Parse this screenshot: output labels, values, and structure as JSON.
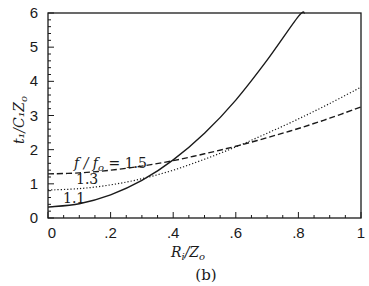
{
  "chart_data": {
    "type": "line",
    "title": "",
    "caption": "(b)",
    "xlabel": "R_i/Z_o",
    "ylabel": "t_1/C_1 Z_o",
    "xlim": [
      0,
      1
    ],
    "ylim": [
      0,
      6
    ],
    "xticks": [
      0,
      0.2,
      0.4,
      0.6,
      0.8,
      1
    ],
    "xtick_labels": [
      "0",
      ".2",
      ".4",
      ".6",
      ".8",
      "1"
    ],
    "yticks": [
      0,
      1,
      2,
      3,
      4,
      5,
      6
    ],
    "ytick_labels": [
      "0",
      "1",
      "2",
      "3",
      "4",
      "5",
      "6"
    ],
    "grid": false,
    "legend": "inline annotations",
    "series": [
      {
        "name": "f/f_o = 1.5",
        "style": "dashed",
        "x": [
          0,
          0.1,
          0.2,
          0.3,
          0.4,
          0.5,
          0.6,
          0.7,
          0.8,
          0.9,
          1.0
        ],
        "values": [
          1.29,
          1.32,
          1.4,
          1.52,
          1.68,
          1.88,
          2.1,
          2.35,
          2.62,
          2.92,
          3.25
        ]
      },
      {
        "name": "f/f_o = 1.3",
        "style": "dotted",
        "x": [
          0,
          0.1,
          0.2,
          0.3,
          0.4,
          0.5,
          0.6,
          0.7,
          0.8,
          0.9,
          1.0
        ],
        "values": [
          0.82,
          0.86,
          0.97,
          1.15,
          1.4,
          1.72,
          2.08,
          2.48,
          2.9,
          3.35,
          3.83
        ]
      },
      {
        "name": "f/f_o = 1.1",
        "style": "solid",
        "x": [
          0,
          0.1,
          0.2,
          0.3,
          0.4,
          0.5,
          0.6,
          0.7,
          0.8,
          0.82
        ],
        "values": [
          0.32,
          0.42,
          0.68,
          1.1,
          1.7,
          2.48,
          3.45,
          4.62,
          5.9,
          6.0
        ]
      }
    ],
    "annotations": [
      {
        "text": "f/f_o = 1.5",
        "x": 0.06,
        "y": 1.55
      },
      {
        "text": "1.3",
        "x": 0.08,
        "y": 1.05
      },
      {
        "text": "1.1",
        "x": 0.05,
        "y": 0.55
      }
    ]
  },
  "labels": {
    "xlabel_main": "R",
    "xlabel_sub": "i",
    "xlabel_rest": "/Z",
    "xlabel_sub2": "o",
    "ylabel_text": "t₁/C₁Z",
    "ylabel_sub": "o",
    "anno_15": "f / f",
    "anno_15_sub": "o",
    "anno_15_rest": " = 1.5",
    "anno_13": "1.3",
    "anno_11": "1.1",
    "caption": "(b)"
  }
}
